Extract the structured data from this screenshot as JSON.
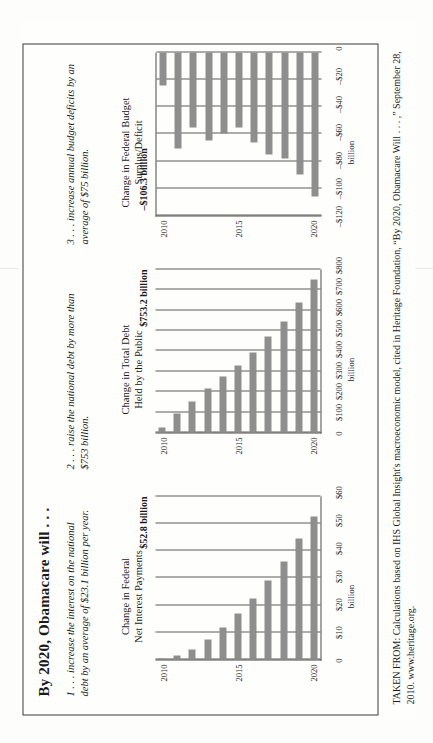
{
  "page": {
    "title": "By 2020, Obamacare will . . .",
    "source": "TAKEN FROM: Calculations based on IHS Global Insight's macroeconomic model, cited in Heritage Foundation, “By 2020, Obamacare Will . . . ,” September 28, 2010. www.heritage.org.",
    "bar_color": "#8e8e8e",
    "frame_color": "#3a3a3a"
  },
  "panels": [
    {
      "blurb": "1 . . . increase the interest on the national debt by an average of $23.1 billion per year.",
      "heading": "Change in Federal\nNet Interest Payments",
      "callout": "$52.8 billion"
    },
    {
      "blurb": "2 . . . raise the national debt by more than $753 billion.",
      "heading": "Change in Total Debt\nHeld by the Public",
      "callout": "$753.2 billion"
    },
    {
      "blurb": "3 . . . increase annual budget deficits by an average of $75 billion.",
      "heading": "Change in Federal Budget\nSurplus/Deficit",
      "callout": "–$106.3 billion"
    }
  ],
  "chart_data": [
    {
      "type": "bar",
      "title": "Change in Federal Net Interest Payments",
      "xlabel": "",
      "ylabel": "billion",
      "categories": [
        "2010",
        "2011",
        "2012",
        "2013",
        "2014",
        "2015",
        "2016",
        "2017",
        "2018",
        "2019",
        "2020"
      ],
      "xtick_labels": [
        "2010",
        "2015",
        "2020"
      ],
      "xtick_positions": [
        0,
        5,
        10
      ],
      "values": [
        0.4,
        1.6,
        3.6,
        7.2,
        11.8,
        17.0,
        22.5,
        29.0,
        36.0,
        44.5,
        52.8
      ],
      "ytick_labels": [
        "$60",
        "$50",
        "$40",
        "$30",
        "$20",
        "$10",
        "0"
      ],
      "ytick_values": [
        60,
        50,
        40,
        30,
        20,
        10,
        0
      ],
      "ylim": [
        0,
        60
      ],
      "annotation": "$52.8 billion",
      "grid": true
    },
    {
      "type": "bar",
      "title": "Change in Total Debt Held by the Public",
      "xlabel": "",
      "ylabel": "billion",
      "categories": [
        "2010",
        "2011",
        "2012",
        "2013",
        "2014",
        "2015",
        "2016",
        "2017",
        "2018",
        "2019",
        "2020"
      ],
      "xtick_labels": [
        "2010",
        "2015",
        "2020"
      ],
      "xtick_positions": [
        0,
        5,
        10
      ],
      "values": [
        24,
        95,
        150,
        215,
        275,
        330,
        395,
        470,
        545,
        640,
        753.2
      ],
      "ytick_labels": [
        "$800",
        "$700",
        "$600",
        "$500",
        "$400",
        "$300",
        "$200",
        "$100",
        "0"
      ],
      "ytick_values": [
        800,
        700,
        600,
        500,
        400,
        300,
        200,
        100,
        0
      ],
      "ylim": [
        0,
        800
      ],
      "annotation": "$753.2 billion",
      "grid": true
    },
    {
      "type": "bar",
      "title": "Change in Federal Budget Surplus/Deficit",
      "xlabel": "",
      "ylabel": "billion",
      "categories": [
        "2010",
        "2011",
        "2012",
        "2013",
        "2014",
        "2015",
        "2016",
        "2017",
        "2018",
        "2019",
        "2020"
      ],
      "xtick_labels": [
        "2010",
        "2015",
        "2020"
      ],
      "xtick_positions": [
        0,
        5,
        10
      ],
      "values": [
        -24,
        -71,
        -55,
        -65,
        -60,
        -55,
        -66,
        -75,
        -78,
        -90,
        -106.3
      ],
      "ytick_labels": [
        "0",
        "–$20",
        "–$40",
        "–$60",
        "–$80",
        "–$100",
        "–$120"
      ],
      "ytick_values": [
        0,
        -20,
        -40,
        -60,
        -80,
        -100,
        -120
      ],
      "ylim": [
        -120,
        0
      ],
      "annotation": "–$106.3 billion",
      "grid": true
    }
  ]
}
